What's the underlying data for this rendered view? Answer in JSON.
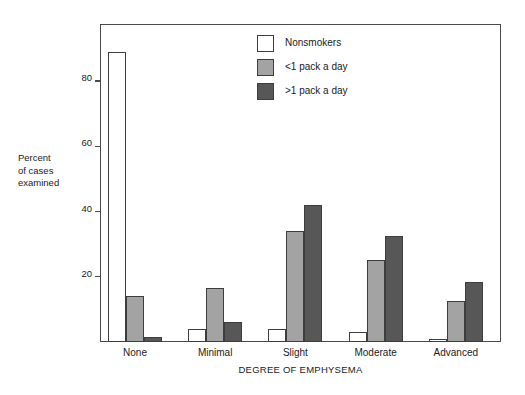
{
  "chart_data": {
    "type": "bar",
    "title": "",
    "xlabel": "DEGREE OF EMPHYSEMA",
    "ylabel": "Percent of cases examined",
    "ylabel_lines": [
      "Percent",
      "of cases",
      "examined"
    ],
    "categories": [
      "None",
      "Minimal",
      "Slight",
      "Moderate",
      "Advanced"
    ],
    "series": [
      {
        "name": "Nonsmokers",
        "color": "#ffffff",
        "values": [
          89,
          4,
          4,
          3,
          1
        ]
      },
      {
        "name": "<1 pack a day",
        "color": "#a3a3a3",
        "values": [
          14,
          16.5,
          34,
          25,
          12.5
        ]
      },
      {
        "name": ">1 pack a day",
        "color": "#575757",
        "values": [
          1.5,
          6,
          42,
          32.5,
          18.5
        ]
      }
    ],
    "ylim": [
      0,
      97.5
    ],
    "yticks": [
      20,
      40,
      60,
      80
    ],
    "ytick_labels": [
      "20",
      "40",
      "60",
      "80"
    ],
    "grid": false,
    "legend_position": "top-center",
    "bar_edge_color": "#3d3d3d",
    "frame_color": "#4a4a4a"
  },
  "axis": {
    "y_title_line1": "Percent",
    "y_title_line2": "of cases",
    "y_title_line3": "examined",
    "x_title": "DEGREE OF EMPHYSEMA"
  },
  "legend": {
    "items": [
      {
        "label": "Nonsmokers"
      },
      {
        "label": "<1 pack a day"
      },
      {
        "label": ">1 pack a day"
      }
    ]
  }
}
